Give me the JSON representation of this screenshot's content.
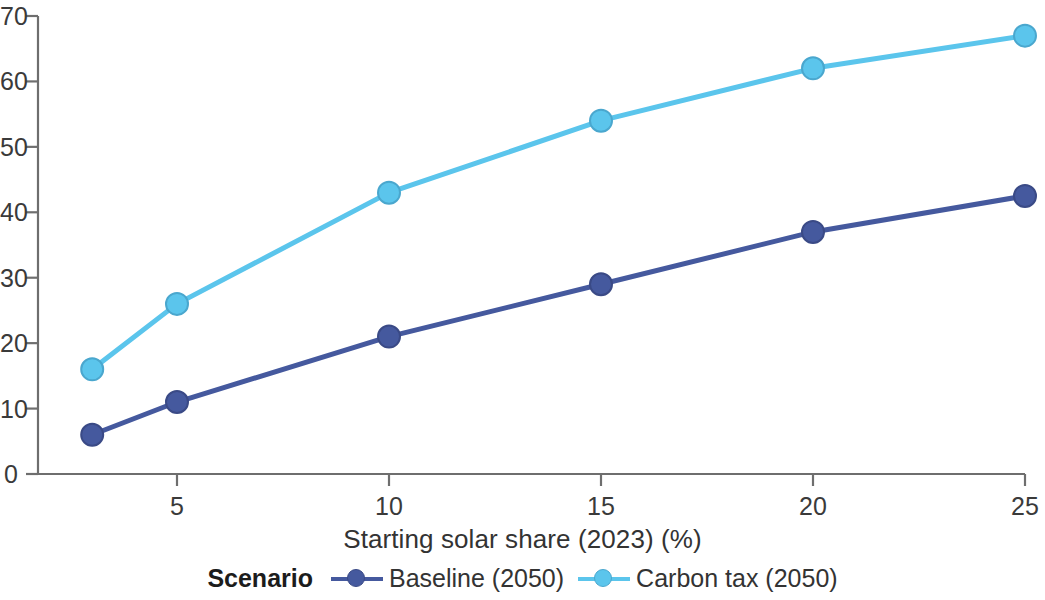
{
  "chart_data": {
    "type": "line",
    "title": "",
    "xlabel": "Starting solar share (2023) (%)",
    "ylabel": "",
    "x": [
      3,
      5,
      10,
      15,
      20,
      25
    ],
    "xlim": [
      2,
      25.6
    ],
    "ylim": [
      0,
      70
    ],
    "xticks": [
      5,
      10,
      15,
      20,
      25
    ],
    "xtick_labels": [
      "5",
      "10",
      "15",
      "20",
      "25"
    ],
    "yticks": [
      0,
      10,
      20,
      30,
      40,
      50,
      60,
      70
    ],
    "ytick_labels": [
      "0",
      "10",
      "20",
      "30",
      "40",
      "50",
      "60",
      "70"
    ],
    "grid": false,
    "legend_position": "bottom",
    "legend_title": "Scenario",
    "series": [
      {
        "name": "Baseline (2050)",
        "color": "#45599e",
        "marker": "circle",
        "values": [
          6,
          11,
          21,
          29,
          37,
          42.5
        ]
      },
      {
        "name": "Carbon tax (2050)",
        "color": "#5bc5ec",
        "marker": "circle",
        "values": [
          16,
          26,
          43,
          54,
          62,
          67
        ]
      }
    ]
  },
  "axis": {
    "line_color": "#6e6e6e",
    "tick_color": "#6e6e6e"
  },
  "legend": {
    "title": "Scenario",
    "items": [
      {
        "label": "Baseline (2050)",
        "color": "#45599e"
      },
      {
        "label": "Carbon tax (2050)",
        "color": "#5bc5ec"
      }
    ]
  }
}
